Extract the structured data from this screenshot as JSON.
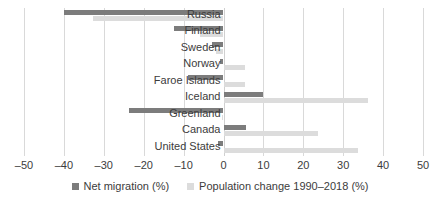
{
  "chart_data": {
    "type": "bar",
    "orientation": "horizontal",
    "title": "",
    "subtitle": "",
    "xlabel": "",
    "ylabel": "",
    "xlim": [
      -50,
      50
    ],
    "xticks": [
      -50,
      -40,
      -30,
      -20,
      -10,
      0,
      10,
      20,
      30,
      40,
      50
    ],
    "xtick_labels": [
      "–50",
      "–40",
      "–30",
      "–20",
      "–10",
      "0",
      "10",
      "20",
      "30",
      "40",
      "50"
    ],
    "grid": true,
    "grid_axis": "x",
    "legend_position": "bottom",
    "categories": [
      "Russia",
      "Finland",
      "Sweden",
      "Norway",
      "Faroe Islands",
      "Iceland",
      "Greenland",
      "Canada",
      "United States"
    ],
    "series": [
      {
        "name": "Net migration (%)",
        "color": "#7c7c7c",
        "values": [
          -40.0,
          -12.4,
          -3.0,
          -1.0,
          -9.0,
          10.0,
          -23.6,
          5.7,
          -1.5
        ]
      },
      {
        "name": "Population change 1990–2018 (%)",
        "color": "#dcdcdc",
        "values": [
          -32.8,
          -6.0,
          -2.0,
          5.4,
          5.4,
          36.3,
          -0.5,
          23.6,
          33.6
        ]
      }
    ]
  },
  "legend": {
    "items": [
      {
        "label": "Net migration (%)",
        "swatch": "dark"
      },
      {
        "label": "Population change 1990–2018 (%)",
        "swatch": "light"
      }
    ]
  },
  "colors": {
    "net_migration": "#7c7c7c",
    "population_change": "#dcdcdc",
    "gridline": "#d9d9d9",
    "text": "#3c3c3c",
    "background": "#ffffff"
  }
}
